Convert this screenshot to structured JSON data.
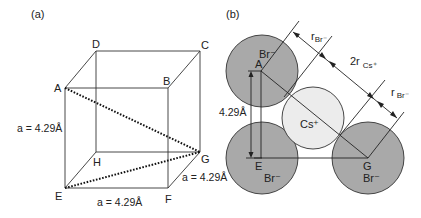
{
  "panel_a": {
    "label": "(a)",
    "vertices": {
      "A": "A",
      "B": "B",
      "C": "C",
      "D": "D",
      "E": "E",
      "F": "F",
      "G": "G",
      "H": "H"
    },
    "edge_labels": {
      "vertical": "a = 4.29Å",
      "bottom": "a = 4.29Å",
      "depth": "a = 4.29Å"
    }
  },
  "panel_b": {
    "label": "(b)",
    "ions": {
      "br_top": "Br⁻",
      "br_bottom_left": "Br⁻",
      "br_bottom_right": "Br⁻",
      "cs": "Cs⁺"
    },
    "points": {
      "A": "A",
      "E": "E",
      "G": "G"
    },
    "dimension_labels": {
      "r_br_1": "r",
      "r_br_1_sub": "Br⁻",
      "two_r_cs": "2r",
      "two_r_cs_sub": "Cs⁺",
      "r_br_2": "r",
      "r_br_2_sub": "Br⁻",
      "height": "4.29Å"
    },
    "colors": {
      "br_fill": "#a9a9a9",
      "cs_fill": "#ececec",
      "stroke": "#333333"
    }
  }
}
